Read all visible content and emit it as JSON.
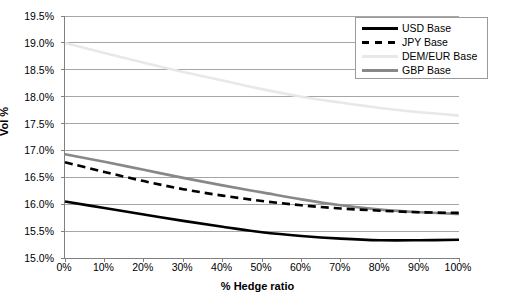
{
  "chart_data": {
    "type": "line",
    "title": "",
    "xlabel": "% Hedge ratio",
    "ylabel": "Vol %",
    "xlim": [
      0,
      100
    ],
    "ylim": [
      15.0,
      19.5
    ],
    "grid": true,
    "legend_position": "top-right",
    "x": [
      0,
      10,
      20,
      30,
      40,
      50,
      60,
      70,
      80,
      90,
      100
    ],
    "x_tick_labels": [
      "0%",
      "10%",
      "20%",
      "30%",
      "40%",
      "50%",
      "60%",
      "70%",
      "80%",
      "90%",
      "100%"
    ],
    "y_tick_labels": [
      "15.0%",
      "15.5%",
      "16.0%",
      "16.5%",
      "17.0%",
      "17.5%",
      "18.0%",
      "18.5%",
      "19.0%",
      "19.5%"
    ],
    "y_ticks": [
      15.0,
      15.5,
      16.0,
      16.5,
      17.0,
      17.5,
      18.0,
      18.5,
      19.0,
      19.5
    ],
    "series": [
      {
        "name": "USD Base",
        "style": "solid",
        "color": "#000000",
        "width": 2.6,
        "values": [
          16.05,
          15.93,
          15.81,
          15.69,
          15.58,
          15.48,
          15.41,
          15.36,
          15.33,
          15.33,
          15.34
        ]
      },
      {
        "name": "JPY Base",
        "style": "dashed",
        "color": "#000000",
        "width": 2.6,
        "values": [
          16.78,
          16.6,
          16.43,
          16.28,
          16.16,
          16.06,
          15.98,
          15.92,
          15.88,
          15.85,
          15.84
        ]
      },
      {
        "name": "DEM/EUR Base",
        "style": "solid",
        "color": "#e8e8e8",
        "width": 2.6,
        "values": [
          19.0,
          18.81,
          18.63,
          18.46,
          18.3,
          18.14,
          18.0,
          17.89,
          17.79,
          17.71,
          17.65
        ]
      },
      {
        "name": "GBP Base",
        "style": "solid",
        "color": "#888888",
        "width": 2.6,
        "values": [
          16.93,
          16.79,
          16.64,
          16.49,
          16.35,
          16.22,
          16.09,
          15.98,
          15.9,
          15.85,
          15.82
        ]
      }
    ]
  },
  "legend": {
    "items": [
      {
        "label": "USD Base",
        "swatch": "solid-black-line-icon"
      },
      {
        "label": "JPY Base",
        "swatch": "dashed-black-line-icon"
      },
      {
        "label": "DEM/EUR Base",
        "swatch": "solid-light-gray-line-icon"
      },
      {
        "label": "GBP Base",
        "swatch": "solid-gray-line-icon"
      }
    ]
  },
  "colors": {
    "gridline": "#a6a6a6",
    "axis": "#808080",
    "usd": "#000000",
    "jpy": "#000000",
    "dem_eur": "#e8e8e8",
    "gbp": "#888888",
    "background": "#ffffff"
  }
}
